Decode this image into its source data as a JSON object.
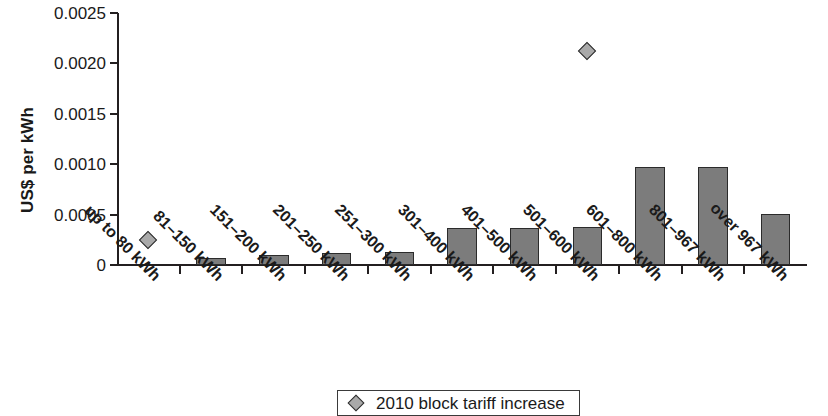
{
  "chart_data": {
    "type": "bar",
    "title": "",
    "xlabel": "",
    "ylabel": "US$ per kWh",
    "ylim": [
      0,
      0.0025
    ],
    "ytick_values": [
      0,
      0.0005,
      0.001,
      0.0015,
      0.002,
      0.0025
    ],
    "ytick_labels": [
      "0",
      "0.0005",
      "0.0010",
      "0.0015",
      "0.0020",
      "0.0025"
    ],
    "grid": false,
    "legend_position": "bottom-center",
    "categories": [
      "up to 80 kWh",
      "81–150 kWh",
      "151–200 kWh",
      "201–250 kWh",
      "251–300 kWh",
      "301–400 kWh",
      "401–500 kWh",
      "501–600 kWh",
      "601–800 kWh",
      "801–967 kWh",
      "over 967 kWh"
    ],
    "series": [
      {
        "name": "bars",
        "type": "bar",
        "color": "#7c7c7c",
        "values": [
          0,
          7e-05,
          0.0001,
          0.00012,
          0.00013,
          0.00037,
          0.00037,
          0.00038,
          0.00097,
          0.00097,
          0.00051
        ]
      },
      {
        "name": "2010 block tariff increase",
        "type": "scatter",
        "marker": "diamond",
        "color": "#a9a9a9",
        "values": [
          0.00025,
          null,
          null,
          null,
          null,
          null,
          null,
          0.00212,
          null,
          null,
          null
        ]
      }
    ]
  },
  "legend": {
    "marker_icon": "diamond-marker-icon",
    "label": "2010 block tariff increase"
  }
}
